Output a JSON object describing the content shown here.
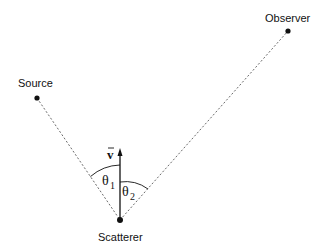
{
  "diagram": {
    "type": "scattering-geometry",
    "nodes": [
      {
        "id": "source",
        "label": "Source",
        "x": 37,
        "y": 98
      },
      {
        "id": "observer",
        "label": "Observer",
        "x": 288,
        "y": 31
      },
      {
        "id": "scatterer",
        "label": "Scatterer",
        "x": 120,
        "y": 220
      }
    ],
    "edges": [
      {
        "from": "source",
        "to": "scatterer",
        "style": "dotted"
      },
      {
        "from": "scatterer",
        "to": "observer",
        "style": "dotted"
      }
    ],
    "velocity_vector": {
      "label": "v",
      "from": "scatterer",
      "direction": "up"
    },
    "angles": [
      {
        "symbol": "θ",
        "subscript": "1",
        "between": [
          "velocity",
          "source-line"
        ]
      },
      {
        "symbol": "θ",
        "subscript": "2",
        "between": [
          "velocity",
          "observer-line"
        ]
      }
    ]
  },
  "labels": {
    "source": "Source",
    "observer": "Observer",
    "scatterer": "Scatterer",
    "velocity": "v",
    "theta1_symbol": "θ",
    "theta1_sub": "1",
    "theta2_symbol": "θ",
    "theta2_sub": "2"
  }
}
